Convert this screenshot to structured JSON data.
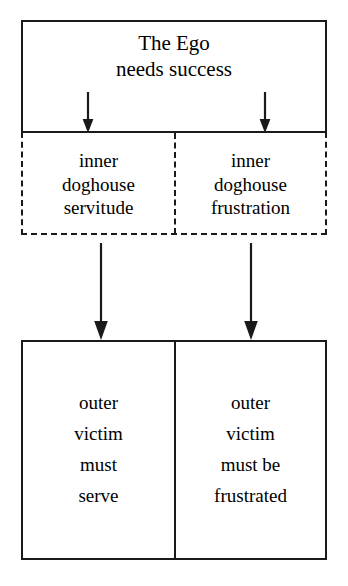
{
  "diagram": {
    "title": "The Ego needs success",
    "top_box": {
      "lines": [
        "The Ego",
        "needs success"
      ],
      "border_style": "solid"
    },
    "middle_row": {
      "border_style": "dashed",
      "cells": [
        {
          "id": "inner-doghouse-servitude",
          "lines": [
            "inner",
            "doghouse",
            "servitude"
          ]
        },
        {
          "id": "inner-doghouse-frustration",
          "lines": [
            "inner",
            "doghouse",
            "frustration"
          ]
        }
      ]
    },
    "bottom_row": {
      "border_style": "solid",
      "cells": [
        {
          "id": "outer-victim-must-serve",
          "lines": [
            "outer",
            "victim",
            "must",
            "serve"
          ]
        },
        {
          "id": "outer-victim-must-be-frustrated",
          "lines": [
            "outer",
            "victim",
            "must be",
            "frustrated"
          ]
        }
      ]
    },
    "arrows": [
      {
        "id": "arrow-ego-to-servitude",
        "icon": "arrow-down-icon",
        "length": "short"
      },
      {
        "id": "arrow-ego-to-frustration",
        "icon": "arrow-down-icon",
        "length": "short"
      },
      {
        "id": "arrow-servitude-to-serve",
        "icon": "arrow-down-icon",
        "length": "long"
      },
      {
        "id": "arrow-frustration-to-frustrated",
        "icon": "arrow-down-icon",
        "length": "long"
      }
    ],
    "colors": {
      "ink": "#1a1a1a",
      "background": "#ffffff"
    }
  }
}
